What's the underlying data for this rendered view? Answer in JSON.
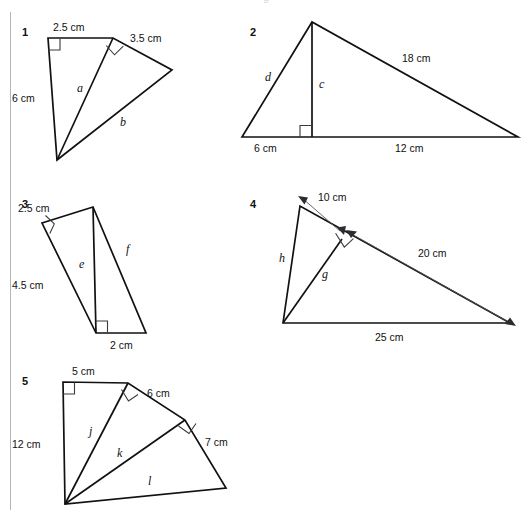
{
  "page": {
    "width": 532,
    "height": 516,
    "background": "#ffffff",
    "ink_color": "#111111",
    "rule_color": "#b4b4b9",
    "arrow_color": "#55555a",
    "top_cut_text": "g"
  },
  "figures": [
    {
      "number": "1",
      "name": "figure-1",
      "labels": {
        "top": "2.5 cm",
        "upper_right": "3.5 cm",
        "left": "6 cm",
        "var_a": "a",
        "var_b": "b"
      },
      "right_angles": 2
    },
    {
      "number": "2",
      "name": "figure-2",
      "labels": {
        "hypotenuse": "18 cm",
        "base_left": "6 cm",
        "base_right": "12 cm",
        "var_c": "c",
        "var_d": "d"
      },
      "right_angles": 1
    },
    {
      "number": "3",
      "name": "figure-3",
      "labels": {
        "top": "2.5 cm",
        "left": "4.5 cm",
        "bottom": "2 cm",
        "var_e": "e",
        "var_f": "f"
      },
      "right_angles": 2
    },
    {
      "number": "4",
      "name": "figure-4",
      "labels": {
        "segment_short": "10 cm",
        "segment_long": "20 cm",
        "base": "25 cm",
        "var_g": "g",
        "var_h": "h"
      },
      "right_angles": 1,
      "dimension_arrows": 2
    },
    {
      "number": "5",
      "name": "figure-5",
      "labels": {
        "top": "5 cm",
        "upper_right": "6 cm",
        "right": "7 cm",
        "left": "12 cm",
        "var_j": "j",
        "var_k": "k",
        "var_l": "l"
      },
      "right_angles": 3
    }
  ]
}
